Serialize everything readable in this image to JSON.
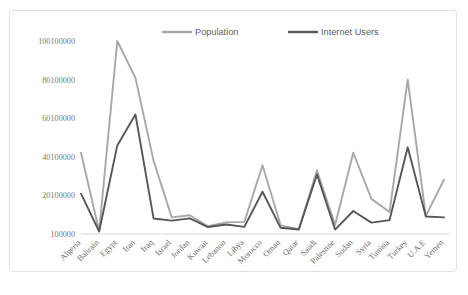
{
  "chart_data": {
    "type": "line",
    "title": "",
    "xlabel": "",
    "ylabel": "",
    "ylim": [
      100000,
      100100000
    ],
    "ytick_values": [
      100000,
      20100000,
      40100000,
      60100000,
      80100000,
      100100000
    ],
    "ytick_labels": [
      "100000",
      "20100000",
      "40100000",
      "60100000",
      "80100000",
      "100100000"
    ],
    "grid": false,
    "legend_position": "top-center",
    "categories": [
      "Algeria",
      "Bahrain",
      "Egypt",
      "Iran",
      "Iraq",
      "Israel",
      "Jordan",
      "Kuwait",
      "Lebanon",
      "Libya",
      "Morocco",
      "Oman",
      "Qatar",
      "Saudi",
      "Palestine",
      "Sudan",
      "Syria",
      "Tunisia",
      "Turkey",
      "U.A.E",
      "Yemen"
    ],
    "series": [
      {
        "name": "Population",
        "color": "#a8a8a8",
        "values": [
          42200000,
          1500000,
          100100000,
          81000000,
          38000000,
          8700000,
          9800000,
          4100000,
          6100000,
          6400000,
          35700000,
          4600000,
          2600000,
          33000000,
          4800000,
          42200000,
          18300000,
          11500000,
          80100000,
          9500000,
          28200000
        ]
      },
      {
        "name": "Internet Users",
        "color": "#575757",
        "values": [
          21000000,
          1400000,
          46000000,
          62000000,
          8100000,
          7000000,
          8200000,
          3700000,
          5000000,
          3800000,
          22000000,
          3300000,
          2400000,
          31000000,
          2400000,
          12000000,
          6000000,
          7300000,
          45000000,
          9200000,
          8700000
        ]
      }
    ]
  },
  "legend": {
    "items": [
      {
        "label": "Population",
        "color": "#a8a8a8"
      },
      {
        "label": "Internet Users",
        "color": "#575757"
      }
    ]
  }
}
